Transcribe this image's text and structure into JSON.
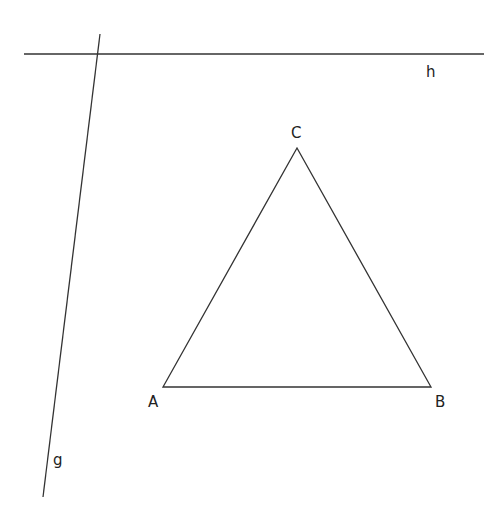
{
  "diagram": {
    "type": "geometry-construction",
    "stroke_color": "#333333",
    "label_color": "#222222",
    "lines": [
      {
        "name": "h",
        "x1": 24,
        "y1": 54,
        "x2": 484,
        "y2": 54,
        "label": "h",
        "label_x": 426,
        "label_y": 77
      },
      {
        "name": "g",
        "x1": 100,
        "y1": 34,
        "x2": 43,
        "y2": 497,
        "label": "g",
        "label_x": 53,
        "label_y": 465
      }
    ],
    "triangle": {
      "vertices": [
        {
          "name": "A",
          "x": 163,
          "y": 387,
          "label_x": 148,
          "label_y": 407
        },
        {
          "name": "B",
          "x": 431,
          "y": 387,
          "label_x": 435,
          "label_y": 407
        },
        {
          "name": "C",
          "x": 297,
          "y": 148,
          "label_x": 291,
          "label_y": 138
        }
      ]
    }
  }
}
